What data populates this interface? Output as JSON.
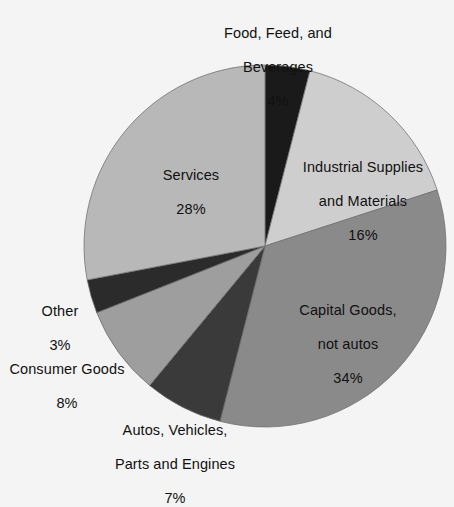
{
  "chart_data": {
    "type": "pie",
    "title": "",
    "xlabel": "",
    "ylabel": "",
    "legend_position": "none",
    "grid": false,
    "labels_inline": true,
    "value_unit": "percent",
    "categories": [
      "Food, Feed, and Beverages",
      "Industrial Supplies and Materials",
      "Capital Goods, not autos",
      "Autos, Vehicles, Parts and Engines",
      "Consumer Goods",
      "Other",
      "Services"
    ],
    "values": [
      4,
      16,
      34,
      7,
      8,
      3,
      28
    ],
    "start_angle_deg": 0,
    "direction": "clockwise",
    "slices": [
      {
        "name": "Food, Feed, and Beverages",
        "label_line1": "Food, Feed, and",
        "label_line2": "Beverages",
        "percent_text": "4%",
        "value": 4,
        "color": "#1a1a1a"
      },
      {
        "name": "Industrial Supplies and Materials",
        "label_line1": "Industrial Supplies",
        "label_line2": "and Materials",
        "percent_text": "16%",
        "value": 16,
        "color": "#cecece"
      },
      {
        "name": "Capital Goods, not autos",
        "label_line1": "Capital Goods,",
        "label_line2": "not autos",
        "percent_text": "34%",
        "value": 34,
        "color": "#8a8a8a"
      },
      {
        "name": "Autos, Vehicles, Parts and Engines",
        "label_line1": "Autos, Vehicles,",
        "label_line2": "Parts and Engines",
        "percent_text": "7%",
        "value": 7,
        "color": "#3a3a3a"
      },
      {
        "name": "Consumer Goods",
        "label_line1": "Consumer Goods",
        "label_line2": "",
        "percent_text": "8%",
        "value": 8,
        "color": "#9e9e9e"
      },
      {
        "name": "Other",
        "label_line1": "Other",
        "label_line2": "",
        "percent_text": "3%",
        "value": 3,
        "color": "#2b2b2b"
      },
      {
        "name": "Services",
        "label_line1": "Services",
        "label_line2": "",
        "percent_text": "28%",
        "value": 28,
        "color": "#b8b8b8"
      }
    ]
  },
  "geometry": {
    "center_x": 265,
    "center_y": 246,
    "radius": 181
  },
  "colors": {
    "background": "#f4f4f4",
    "text": "#111111",
    "slice_outline": "#6e6e6e"
  }
}
